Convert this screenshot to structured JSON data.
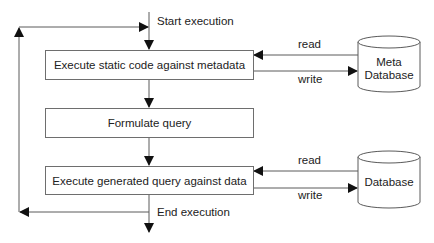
{
  "diagram": {
    "type": "flowchart",
    "start_label": "Start execution",
    "end_label": "End execution",
    "steps": [
      {
        "id": "step1",
        "label": "Execute static code against metadata"
      },
      {
        "id": "step2",
        "label": "Formulate query"
      },
      {
        "id": "step3",
        "label": "Execute generated query against data"
      }
    ],
    "stores": [
      {
        "id": "meta_db",
        "label_line1": "Meta",
        "label_line2": "Database",
        "read_label": "read",
        "write_label": "write"
      },
      {
        "id": "db",
        "label_line1": "",
        "label_line2": "Database",
        "read_label": "read",
        "write_label": "write"
      }
    ],
    "colors": {
      "line": "#5a5a5a",
      "box_border": "#6e6e6e",
      "text": "#222222"
    }
  }
}
